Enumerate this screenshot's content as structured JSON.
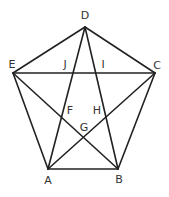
{
  "diagram": {
    "stroke_color": "#222222",
    "label_color": "#333333",
    "vertices": {
      "A": [
        48,
        169
      ],
      "B": [
        118,
        169
      ],
      "C": [
        155,
        73
      ],
      "D": [
        85,
        27
      ],
      "E": [
        13,
        73
      ]
    },
    "edges": [
      [
        "A",
        "B"
      ],
      [
        "B",
        "C"
      ],
      [
        "C",
        "D"
      ],
      [
        "D",
        "E"
      ],
      [
        "E",
        "A"
      ],
      [
        "A",
        "C"
      ],
      [
        "A",
        "D"
      ],
      [
        "B",
        "D"
      ],
      [
        "B",
        "E"
      ],
      [
        "C",
        "E"
      ]
    ],
    "labels": [
      {
        "text": "D",
        "x": 85,
        "y": 16
      },
      {
        "text": "E",
        "x": 12,
        "y": 65
      },
      {
        "text": "J",
        "x": 65,
        "y": 65
      },
      {
        "text": "I",
        "x": 103,
        "y": 65
      },
      {
        "text": "C",
        "x": 157,
        "y": 66
      },
      {
        "text": "F",
        "x": 70,
        "y": 111
      },
      {
        "text": "H",
        "x": 97,
        "y": 111
      },
      {
        "text": "G",
        "x": 84,
        "y": 128
      },
      {
        "text": "A",
        "x": 48,
        "y": 181
      },
      {
        "text": "B",
        "x": 119,
        "y": 180
      }
    ]
  }
}
